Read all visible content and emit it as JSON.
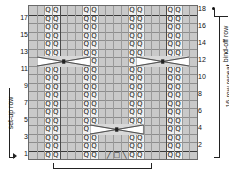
{
  "chart_data": {
    "type": "table",
    "rows": 18,
    "columns": 22,
    "row_numbers_left": [
      "17",
      "15",
      "13",
      "11",
      "9",
      "7",
      "5",
      "3",
      "1"
    ],
    "row_numbers_right": [
      "18",
      "16",
      "14",
      "12",
      "10",
      "8",
      "6",
      "4",
      "2"
    ],
    "annotations": {
      "set_up_row": "set-up row",
      "row_repeat": "16-row repeat",
      "bind_off_row": "bind-off row",
      "stitch_repeat_bracket": ""
    },
    "symbols": {
      "twisted_knit": "Q",
      "purl_background": "",
      "yarn_over": "O",
      "left_decrease": "/",
      "right_decrease": "\\",
      "cable_cross": "X"
    },
    "special_cells": [
      {
        "row": 1,
        "col_start": 10,
        "label": "left-decrease / yarn-over / right-decrease"
      },
      {
        "row": 4,
        "col_start": 8,
        "span": 7,
        "label": "cable-cross"
      },
      {
        "row": 12,
        "col_start": 1,
        "span": 7,
        "label": "cable-cross"
      },
      {
        "row": 12,
        "col_start": 14,
        "span": 7,
        "label": "cable-cross"
      }
    ],
    "colors": {
      "background": "#e9e9e9",
      "shaded_column": "#c9c9c9",
      "light_column": "#efefef",
      "grid_line": "#8d8d8d",
      "heavy_line": "#3a3a3a",
      "text": "#111111"
    }
  },
  "labels": {
    "set_up_row": "set-up row",
    "repeat": "16-row repeat",
    "bind_off_row": "bind-off row"
  },
  "left_numbers": [
    "17",
    "15",
    "13",
    "11",
    "9",
    "7",
    "5",
    "3",
    "1"
  ],
  "right_numbers": [
    "18",
    "16",
    "14",
    "12",
    "10",
    "8",
    "6",
    "4",
    "2"
  ],
  "cell_symbol": "Q",
  "row1_symbols": [
    "╱",
    "□",
    "╲"
  ]
}
